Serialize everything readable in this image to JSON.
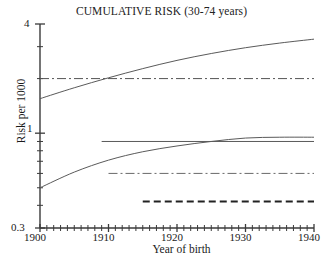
{
  "chart_data": {
    "type": "line",
    "title": "CUMULATIVE RISK (30-74 years)",
    "xlabel": "Year of birth",
    "ylabel": "Risk per 1000",
    "xlim": [
      1900,
      1940
    ],
    "ylim": [
      0.3,
      4
    ],
    "yscale": "log",
    "xscale": "linear",
    "grid": false,
    "legend": "none",
    "xticks": [
      1900,
      1910,
      1920,
      1930,
      1940
    ],
    "xtick_labels": [
      "1900",
      "1910",
      "1920",
      "1930",
      "1940"
    ],
    "xminor_tick_interval": 1,
    "yticks": [
      0.3,
      1,
      4
    ],
    "ytick_labels": [
      "0.3",
      "1",
      "4"
    ],
    "yminor_ticks": [
      0.4,
      0.5,
      0.6,
      0.7,
      0.8,
      0.9,
      2,
      3
    ],
    "series": [
      {
        "name": "upper-rising-curve",
        "style": "solid",
        "linewidth": 1,
        "color": "#5a5a5a",
        "x": [
          1900,
          1905,
          1910,
          1915,
          1920,
          1925,
          1930,
          1935,
          1940
        ],
        "values": [
          1.55,
          1.78,
          2.02,
          2.27,
          2.52,
          2.75,
          2.96,
          3.14,
          3.3
        ]
      },
      {
        "name": "upper-constant-dashdot",
        "style": "dashdot",
        "linewidth": 1,
        "color": "#555555",
        "x": [
          1900,
          1940
        ],
        "values": [
          2.0,
          2.0
        ]
      },
      {
        "name": "lower-rising-curve",
        "style": "solid",
        "linewidth": 1,
        "color": "#5a5a5a",
        "x": [
          1900,
          1905,
          1910,
          1915,
          1920,
          1925,
          1930,
          1935,
          1940
        ],
        "values": [
          0.5,
          0.61,
          0.71,
          0.79,
          0.85,
          0.9,
          0.94,
          0.95,
          0.95
        ]
      },
      {
        "name": "lower-constant-solid",
        "style": "solid",
        "linewidth": 1,
        "color": "#5a5a5a",
        "x": [
          1909,
          1940
        ],
        "values": [
          0.9,
          0.9
        ]
      },
      {
        "name": "lower-constant-dashdot",
        "style": "dashdot",
        "linewidth": 1,
        "color": "#6a6a6a",
        "x": [
          1910,
          1940
        ],
        "values": [
          0.6,
          0.6
        ]
      },
      {
        "name": "lowest-constant-dashed",
        "style": "dashed",
        "linewidth": 1.8,
        "color": "#222222",
        "x": [
          1915,
          1940
        ],
        "values": [
          0.42,
          0.42
        ]
      }
    ]
  },
  "axes": {
    "y_label": "Risk per 1000",
    "x_label": "Year of birth",
    "y_tick_labels": {
      "top": "4",
      "middle": "1",
      "bottom": "0.3"
    },
    "x_tick_labels": [
      "1900",
      "1910",
      "1920",
      "1930",
      "1940"
    ]
  }
}
